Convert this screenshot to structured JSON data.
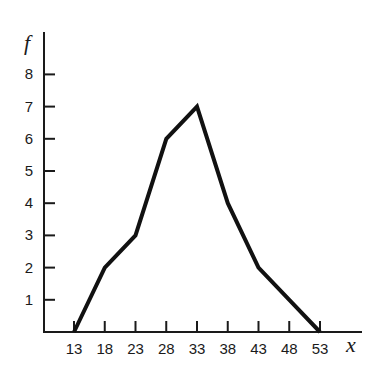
{
  "chart_data": {
    "type": "line",
    "title": "",
    "xlabel": "x",
    "ylabel": "f",
    "x": [
      13,
      18,
      23,
      28,
      33,
      38,
      43,
      48,
      53
    ],
    "categories": [
      "13",
      "18",
      "23",
      "28",
      "33",
      "38",
      "43",
      "48",
      "53"
    ],
    "values": [
      0,
      2,
      3,
      6,
      7,
      4,
      2,
      1,
      0
    ],
    "series": [
      {
        "name": "frequency polygon",
        "x": [
          13,
          18,
          23,
          28,
          33,
          38,
          43,
          48,
          53
        ],
        "values": [
          0,
          2,
          3,
          6,
          7,
          4,
          2,
          1,
          0
        ]
      }
    ],
    "y_ticks": [
      "1",
      "2",
      "3",
      "4",
      "5",
      "6",
      "7",
      "8"
    ],
    "xlim": [
      8,
      58
    ],
    "ylim": [
      0,
      9
    ],
    "grid": false,
    "legend": "none",
    "line_color": "#111111"
  }
}
